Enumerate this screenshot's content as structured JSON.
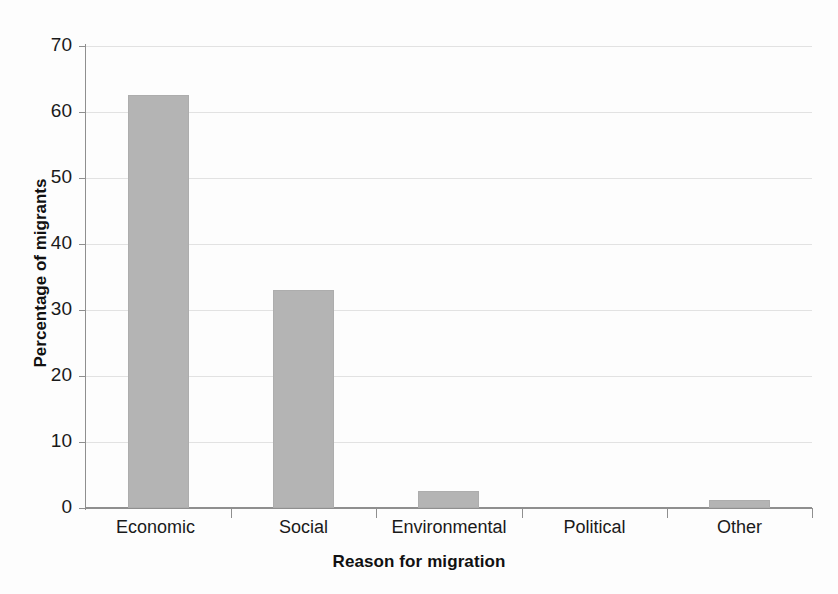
{
  "chart_data": {
    "type": "bar",
    "title": "",
    "xlabel": "Reason for migration",
    "ylabel": "Percentage of migrants",
    "categories": [
      "Economic",
      "Social",
      "Environmental",
      "Political",
      "Other"
    ],
    "values": [
      62.5,
      33,
      2.6,
      0,
      1.2
    ],
    "series": [
      {
        "name": "Percentage of migrants",
        "values": [
          62.5,
          33,
          2.6,
          0,
          1.2
        ]
      }
    ],
    "ylim": [
      0,
      70
    ],
    "yticks": [
      0,
      10,
      20,
      30,
      40,
      50,
      60,
      70
    ],
    "ytick_labels": [
      "0",
      "10",
      "20",
      "30",
      "40",
      "50",
      "60",
      "70"
    ],
    "grid": true,
    "grid_axis": "y",
    "legend": false,
    "legend_position": "none",
    "bar_color": "#b4b4b4",
    "axis_color": "#8f8f8f",
    "gridline_color": "#e2e2e2",
    "text_color": "#1a1a1a"
  }
}
